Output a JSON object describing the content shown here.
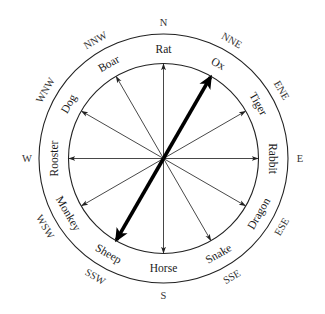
{
  "diagram": {
    "center": [
      163.5,
      158.5
    ],
    "outer_radius": 124.5,
    "inner_radius": 95,
    "line_color": "#222222",
    "pointer": {
      "angles_deg": [
        30,
        210
      ],
      "label": "Ox-Sheep axis"
    },
    "animals": [
      {
        "label": "Rat",
        "angle": 0
      },
      {
        "label": "Ox",
        "angle": 30
      },
      {
        "label": "Tiger",
        "angle": 60
      },
      {
        "label": "Rabbit",
        "angle": 90
      },
      {
        "label": "Dragon",
        "angle": 120
      },
      {
        "label": "Snake",
        "angle": 150
      },
      {
        "label": "Horse",
        "angle": 180
      },
      {
        "label": "Sheep",
        "angle": 210
      },
      {
        "label": "Monkey",
        "angle": 240
      },
      {
        "label": "Rooster",
        "angle": 270
      },
      {
        "label": "Dog",
        "angle": 300
      },
      {
        "label": "Boar",
        "angle": 330
      }
    ],
    "compass": [
      {
        "label": "N",
        "angle": 0
      },
      {
        "label": "NNE",
        "angle": 30
      },
      {
        "label": "ENE",
        "angle": 60
      },
      {
        "label": "E",
        "angle": 90
      },
      {
        "label": "ESE",
        "angle": 120
      },
      {
        "label": "SSE",
        "angle": 150
      },
      {
        "label": "S",
        "angle": 180
      },
      {
        "label": "SSW",
        "angle": 210
      },
      {
        "label": "WSW",
        "angle": 240
      },
      {
        "label": "W",
        "angle": 270
      },
      {
        "label": "WNW",
        "angle": 300
      },
      {
        "label": "NNW",
        "angle": 330
      }
    ]
  }
}
